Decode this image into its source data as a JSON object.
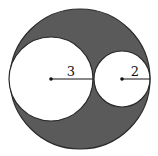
{
  "diagram": {
    "type": "geometry-circles",
    "colors": {
      "background": "#ffffff",
      "shaded_region": "#5a5a5a",
      "outline": "#2a2a2a",
      "inner_fill": "#ffffff",
      "radius_line": "#111111"
    },
    "outer_circle": {
      "cx": 80,
      "cy": 79,
      "r": 70
    },
    "large_circle": {
      "cx": 51,
      "cy": 79,
      "r": 42,
      "radius_label": "3"
    },
    "small_circle": {
      "cx": 122,
      "cy": 79,
      "r": 28,
      "radius_label": "2"
    }
  }
}
